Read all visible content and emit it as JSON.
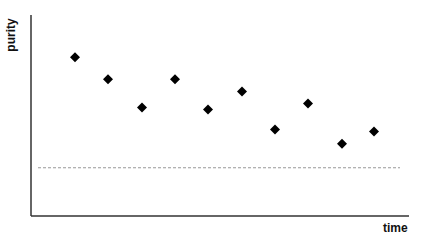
{
  "chart_data": {
    "type": "scatter",
    "title": "",
    "xlabel": "time",
    "ylabel": "purity",
    "marker": "diamond",
    "x": [
      1,
      2,
      3,
      4,
      5,
      6,
      7,
      8,
      9,
      10
    ],
    "series": [
      {
        "name": "purity",
        "values": [
          79,
          68,
          54,
          68,
          53,
          62,
          43,
          56,
          36,
          42
        ]
      }
    ],
    "reference_line": {
      "style": "dashed",
      "value": 24,
      "color": "#999999"
    },
    "ylim": [
      0,
      100
    ],
    "xlim": [
      0,
      11
    ],
    "ticks": false,
    "grid": false,
    "legend": null,
    "colors": {
      "marker": "#000000",
      "axis": "#333333"
    }
  }
}
